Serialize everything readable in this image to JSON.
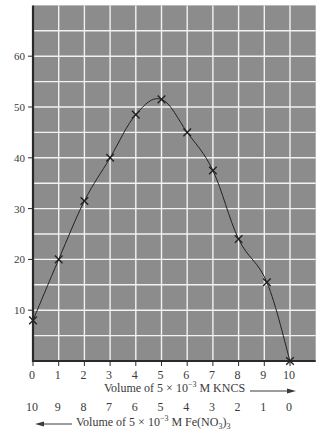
{
  "chart_data": {
    "type": "line",
    "title": "",
    "x": [
      0,
      1,
      2,
      3,
      4,
      5,
      6,
      7,
      8,
      9,
      10
    ],
    "x_secondary": [
      10,
      9,
      8,
      7,
      6,
      5,
      4,
      3,
      2,
      1,
      0
    ],
    "series": [
      {
        "name": "Job's method (continuous variation) curve",
        "x": [
          0,
          1,
          2,
          3,
          4,
          5,
          6,
          7,
          8,
          9.1,
          10
        ],
        "values": [
          8,
          20,
          31.5,
          40,
          48.5,
          51.5,
          45,
          37.5,
          24,
          15.5,
          0
        ],
        "marker": "x",
        "color": "#222222"
      }
    ],
    "xlabel": "Volume of 5 × 10⁻³ M KNCS →",
    "xlabel_secondary": "← Volume of 5 × 10⁻³ M Fe(NO₃)₃",
    "ylabel": "",
    "xlim": [
      0,
      11
    ],
    "ylim": [
      0,
      70
    ],
    "xticks": [
      "0",
      "1",
      "2",
      "3",
      "4",
      "5",
      "6",
      "7",
      "8",
      "9",
      "10"
    ],
    "xticks_secondary": [
      "10",
      "9",
      "8",
      "7",
      "6",
      "5",
      "4",
      "3",
      "2",
      "1",
      "0"
    ],
    "yticks": [
      "10",
      "20",
      "30",
      "40",
      "50",
      "60"
    ],
    "grid": true,
    "grid_spacing": {
      "x": 1,
      "y": 5
    },
    "legend": "none",
    "colors": {
      "plot_background": "#8c8c8c",
      "grid": "#f2f2f2",
      "axis": "#2a2a2a",
      "line": "#222222",
      "text": "#3a3a3a"
    }
  },
  "labels": {
    "xlabel_prefix": "Volume of 5 × 10",
    "xlabel_exp": "−3",
    "xlabel_suffix": " M KNCS",
    "xlabel2_prefix": "Volume of 5 × 10",
    "xlabel2_exp": "−3",
    "xlabel2_mid": " M Fe(NO",
    "xlabel2_sub1": "3",
    "xlabel2_close": ")",
    "xlabel2_sub2": "3"
  }
}
